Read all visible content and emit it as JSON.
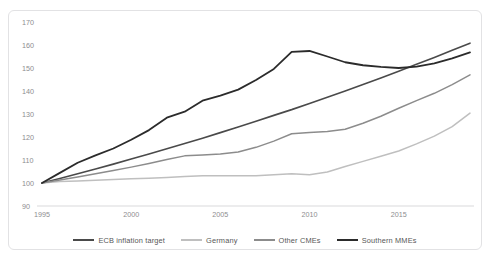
{
  "chart_data": {
    "type": "line",
    "title": "",
    "xlabel": "",
    "ylabel": "",
    "xlim": [
      1995,
      2019
    ],
    "ylim": [
      90,
      170
    ],
    "y_ticks": [
      90,
      100,
      110,
      120,
      130,
      140,
      150,
      160,
      170
    ],
    "x_ticks": [
      1995,
      2000,
      2005,
      2010,
      2015
    ],
    "grid": false,
    "legend_position": "bottom",
    "x": [
      1995,
      1996,
      1997,
      1998,
      1999,
      2000,
      2001,
      2002,
      2003,
      2004,
      2005,
      2006,
      2007,
      2008,
      2009,
      2010,
      2011,
      2012,
      2013,
      2014,
      2015,
      2016,
      2017,
      2018,
      2019
    ],
    "series": [
      {
        "name": "ECB inflation target",
        "color": "#4a4a4a",
        "width": 1.6,
        "values": [
          100.0,
          102.0,
          104.0,
          106.1,
          108.2,
          110.4,
          112.6,
          114.9,
          117.2,
          119.5,
          121.9,
          124.3,
          126.8,
          129.4,
          131.9,
          134.6,
          137.3,
          140.0,
          142.8,
          145.7,
          148.6,
          151.6,
          154.6,
          157.7,
          160.8
        ]
      },
      {
        "name": "Germany",
        "color": "#bfbfbf",
        "width": 1.5,
        "values": [
          100.0,
          100.6,
          100.9,
          101.2,
          101.5,
          101.8,
          102.1,
          102.4,
          102.8,
          103.1,
          103.2,
          103.2,
          103.1,
          103.6,
          104.0,
          103.6,
          104.8,
          107.2,
          109.4,
          111.6,
          113.9,
          117.0,
          120.4,
          124.5,
          130.4
        ]
      },
      {
        "name": "Other CMEs",
        "color": "#8c8c8c",
        "width": 1.5,
        "values": [
          100.0,
          101.3,
          102.6,
          104.0,
          105.4,
          106.9,
          108.5,
          110.2,
          111.8,
          112.2,
          112.6,
          113.5,
          115.5,
          118.2,
          121.4,
          122.0,
          122.4,
          123.4,
          126.0,
          129.0,
          132.5,
          135.8,
          139.0,
          142.8,
          147.0
        ]
      },
      {
        "name": "Southern MMEs",
        "color": "#2b2b2b",
        "width": 1.8,
        "values": [
          100.0,
          104.4,
          108.8,
          112.0,
          115.0,
          118.8,
          123.0,
          128.4,
          131.0,
          135.8,
          138.0,
          140.6,
          144.8,
          149.6,
          157.0,
          157.4,
          155.0,
          152.5,
          151.2,
          150.5,
          150.0,
          150.6,
          152.0,
          154.2,
          156.8
        ]
      }
    ]
  },
  "legend": {
    "items": [
      {
        "label": "ECB inflation target",
        "color": "#4a4a4a",
        "width": 2.2
      },
      {
        "label": "Germany",
        "color": "#bfbfbf",
        "width": 2.0
      },
      {
        "label": "Other CMEs",
        "color": "#8c8c8c",
        "width": 2.0
      },
      {
        "label": "Southern MMEs",
        "color": "#2b2b2b",
        "width": 2.6
      }
    ]
  },
  "axes": {
    "y_tick_labels": [
      "170",
      "160",
      "150",
      "140",
      "130",
      "120",
      "110",
      "100",
      "90"
    ],
    "x_tick_labels": [
      "1995",
      "2000",
      "2005",
      "2010",
      "2015"
    ]
  },
  "colors": {
    "axis_line": "#d9d9db",
    "tick_text": "#8d8d8f",
    "frame_border": "#e2e2e4",
    "background": "#ffffff"
  }
}
